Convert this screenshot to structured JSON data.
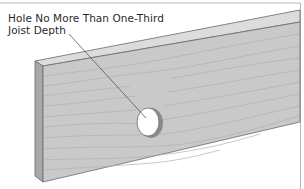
{
  "figure": {
    "callout": {
      "line1": "Hole No More Than One-Third",
      "line2": "Joist Depth"
    },
    "colors": {
      "background": "#ffffff",
      "frame": "#b5b5b5",
      "board_face": "#c9c9c9",
      "board_top": "#dcdcdc",
      "board_end": "#a9a9a9",
      "edge_line": "#6a6a6a",
      "grain": "#b3b3b3",
      "hole_fill": "#ffffff",
      "hole_rim": "#7d7d7d",
      "text": "#2a2a2a",
      "leader": "#555555"
    }
  }
}
